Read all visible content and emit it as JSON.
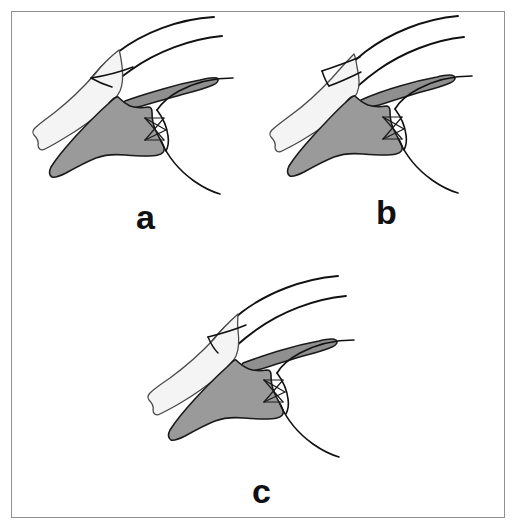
{
  "figure": {
    "panel_count": 3,
    "background_color": "#ffffff",
    "frame_color": "#8e9094",
    "outline_color": "#111111",
    "shade_dark_color": "#999999",
    "shade_light_color": "#f2f2f2",
    "panels": [
      {
        "id": "a",
        "label": "a",
        "description": "Skull with upper jaw in neutral / lowest position; shaded palatal and pterygoid elements, crossed ligament bundle at quadrate joint"
      },
      {
        "id": "b",
        "label": "b",
        "description": "Skull with upper jaw elevated; shaded elements shifted rostrally"
      },
      {
        "id": "c",
        "label": "c",
        "description": "Skull with upper jaw in intermediate position; shaded elements in third configuration"
      }
    ]
  }
}
